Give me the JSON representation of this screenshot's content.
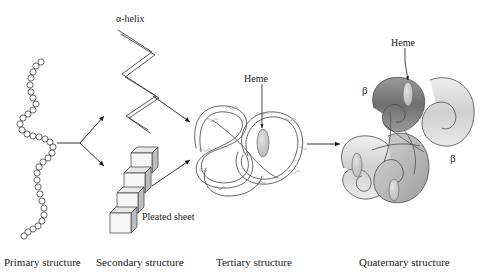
{
  "figure": {
    "background": "#ffffff",
    "ink": "#1a1a1a",
    "subunit_dark": "#808080",
    "subunit_light": "#d9d9d9",
    "heme_fill": "#c6c6c6"
  },
  "stage_labels": [
    {
      "text": "Primary structure",
      "x": 4,
      "y": 257
    },
    {
      "text": "Secondary structure",
      "x": 96,
      "y": 257
    },
    {
      "text": "Tertiary structure",
      "x": 216,
      "y": 257
    },
    {
      "text": "Quaternary structure",
      "x": 359,
      "y": 257
    }
  ],
  "inner_labels": [
    {
      "name": "alpha-helix-label",
      "text": "α-helix",
      "x": 116,
      "y": 14
    },
    {
      "name": "pleated-sheet-label",
      "text": "Pleated sheet",
      "x": 142,
      "y": 212
    },
    {
      "name": "heme-label-tertiary",
      "text": "Heme",
      "x": 244,
      "y": 74
    },
    {
      "name": "heme-label-quaternary",
      "text": "Heme",
      "x": 391,
      "y": 38
    }
  ],
  "greek_labels": [
    {
      "name": "beta-label-upper-left",
      "text": "β",
      "x": 362,
      "y": 85
    },
    {
      "name": "beta-label-lower-right",
      "text": "β",
      "x": 450,
      "y": 153
    }
  ],
  "structures": {
    "primary": {
      "description": "beaded polypeptide chain",
      "bead_count": 40
    },
    "alpha_helix": {
      "description": "zigzag ribbon coil"
    },
    "pleated_sheet": {
      "description": "stacked 3D cubes",
      "cube_count": 4
    },
    "tertiary": {
      "description": "folded globular chain with heme group",
      "heme_count": 1
    },
    "quaternary": {
      "description": "four interlocking subunits",
      "subunit_count": 4,
      "heme_count": 3
    }
  },
  "arrows": [
    {
      "name": "arrow-primary-to-secondary-upper",
      "from": "primary",
      "to": "alpha-helix"
    },
    {
      "name": "arrow-primary-to-secondary-lower",
      "from": "primary",
      "to": "pleated-sheet"
    },
    {
      "name": "arrow-helix-to-tertiary",
      "from": "alpha-helix",
      "to": "tertiary"
    },
    {
      "name": "arrow-sheet-to-tertiary",
      "from": "pleated-sheet",
      "to": "tertiary"
    },
    {
      "name": "arrow-tertiary-to-quaternary",
      "from": "tertiary",
      "to": "quaternary"
    }
  ]
}
